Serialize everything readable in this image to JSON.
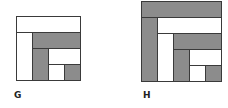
{
  "colors": {
    "shaded": "#8c8c8c",
    "blank": "#ffffff",
    "stroke": "#3a3a3a"
  },
  "figures": [
    {
      "label": "G",
      "x": 16,
      "y": 16,
      "size": 64,
      "label_pos": {
        "x": 14,
        "y": 91
      },
      "cells": [
        {
          "x": 0,
          "y": 0,
          "w": 64,
          "h": 16,
          "fill": "blank"
        },
        {
          "x": 0,
          "y": 16,
          "w": 16,
          "h": 48,
          "fill": "blank"
        },
        {
          "x": 16,
          "y": 16,
          "w": 48,
          "h": 16,
          "fill": "shaded"
        },
        {
          "x": 16,
          "y": 32,
          "w": 16,
          "h": 32,
          "fill": "shaded"
        },
        {
          "x": 32,
          "y": 32,
          "w": 32,
          "h": 16,
          "fill": "blank"
        },
        {
          "x": 32,
          "y": 48,
          "w": 16,
          "h": 16,
          "fill": "blank"
        },
        {
          "x": 48,
          "y": 48,
          "w": 16,
          "h": 16,
          "fill": "shaded"
        }
      ]
    },
    {
      "label": "H",
      "x": 141,
      "y": 1,
      "size": 80,
      "label_pos": {
        "x": 143,
        "y": 91
      },
      "cells": [
        {
          "x": 0,
          "y": 0,
          "w": 80,
          "h": 16,
          "fill": "shaded"
        },
        {
          "x": 0,
          "y": 16,
          "w": 16,
          "h": 64,
          "fill": "shaded"
        },
        {
          "x": 16,
          "y": 16,
          "w": 64,
          "h": 16,
          "fill": "blank"
        },
        {
          "x": 16,
          "y": 32,
          "w": 16,
          "h": 48,
          "fill": "blank"
        },
        {
          "x": 32,
          "y": 32,
          "w": 48,
          "h": 16,
          "fill": "shaded"
        },
        {
          "x": 32,
          "y": 48,
          "w": 16,
          "h": 32,
          "fill": "shaded"
        },
        {
          "x": 48,
          "y": 48,
          "w": 32,
          "h": 16,
          "fill": "blank"
        },
        {
          "x": 48,
          "y": 64,
          "w": 16,
          "h": 16,
          "fill": "blank"
        },
        {
          "x": 64,
          "y": 64,
          "w": 16,
          "h": 16,
          "fill": "shaded"
        }
      ]
    }
  ]
}
